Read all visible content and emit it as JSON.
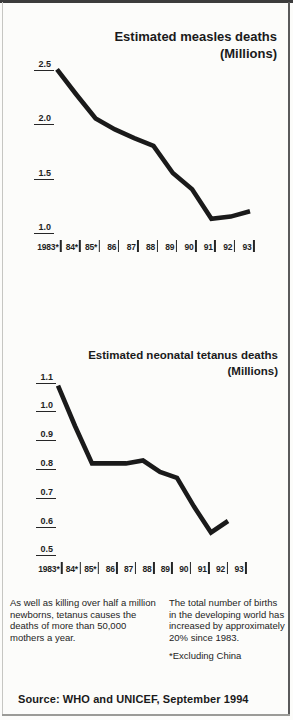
{
  "chart_data": [
    {
      "type": "line",
      "title": "Estimated measles deaths",
      "subtitle": "(Millions)",
      "categories": [
        "1983*",
        "84*",
        "85*",
        "86",
        "87",
        "88",
        "89",
        "90",
        "91",
        "92",
        "93"
      ],
      "values": [
        2.45,
        2.22,
        2.0,
        1.9,
        1.82,
        1.75,
        1.5,
        1.35,
        1.08,
        1.1,
        1.15
      ],
      "yticks": [
        2.5,
        2.0,
        1.5,
        1.0
      ],
      "ylim": [
        1.0,
        2.5
      ],
      "xlabel": "",
      "ylabel": "Millions",
      "grid": false,
      "legend": false,
      "line_color": "#1a1a1a"
    },
    {
      "type": "line",
      "title": "Estimated neonatal tetanus deaths",
      "subtitle": "(Millions)",
      "categories": [
        "1983*",
        "84*",
        "85*",
        "86",
        "87",
        "88",
        "89",
        "90",
        "91",
        "92",
        "93"
      ],
      "values": [
        1.07,
        0.93,
        0.8,
        0.8,
        0.8,
        0.81,
        0.77,
        0.75,
        0.65,
        0.56,
        0.6
      ],
      "yticks": [
        1.1,
        1.0,
        0.9,
        0.8,
        0.7,
        0.6,
        0.5
      ],
      "ylim": [
        0.5,
        1.1
      ],
      "xlabel": "",
      "ylabel": "Millions",
      "grid": false,
      "legend": false,
      "line_color": "#1a1a1a"
    }
  ],
  "notes": {
    "left": "As well as killing over half a million newborns, tetanus causes the deaths of more than 50,000 mothers a year.",
    "right": "The total number of births in the developing world has increased by approximately 20% since 1983.",
    "asterisk": "*Excluding China"
  },
  "source": "Source: WHO and UNICEF, September 1994"
}
